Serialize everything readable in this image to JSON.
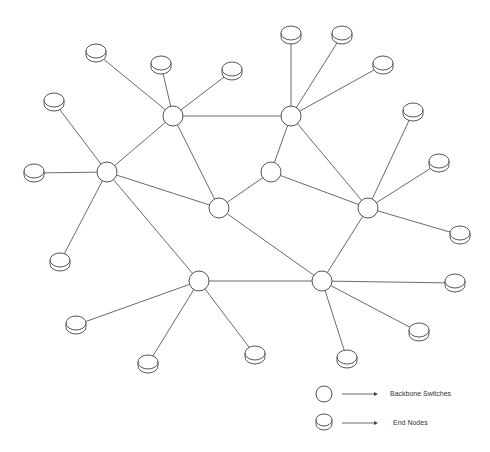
{
  "diagram": {
    "type": "network-topology",
    "switches": [
      {
        "id": "S1",
        "x": 173,
        "y": 116
      },
      {
        "id": "S2",
        "x": 291,
        "y": 116
      },
      {
        "id": "S3",
        "x": 107,
        "y": 172
      },
      {
        "id": "S4",
        "x": 271,
        "y": 172
      },
      {
        "id": "S5",
        "x": 219,
        "y": 208
      },
      {
        "id": "S6",
        "x": 368,
        "y": 208
      },
      {
        "id": "S7",
        "x": 199,
        "y": 281
      },
      {
        "id": "S8",
        "x": 322,
        "y": 281
      }
    ],
    "end_nodes": [
      {
        "id": "E1",
        "x": 96,
        "y": 51,
        "switch": "S1"
      },
      {
        "id": "E2",
        "x": 161,
        "y": 63,
        "switch": "S1"
      },
      {
        "id": "E3",
        "x": 232,
        "y": 69,
        "switch": "S1"
      },
      {
        "id": "E4",
        "x": 291,
        "y": 33,
        "switch": "S2"
      },
      {
        "id": "E5",
        "x": 342,
        "y": 33,
        "switch": "S2"
      },
      {
        "id": "E6",
        "x": 383,
        "y": 63,
        "switch": "S2"
      },
      {
        "id": "E7",
        "x": 54,
        "y": 100,
        "switch": "S3"
      },
      {
        "id": "E8",
        "x": 34,
        "y": 171,
        "switch": "S3"
      },
      {
        "id": "E9",
        "x": 60,
        "y": 260,
        "switch": "S3"
      },
      {
        "id": "E10",
        "x": 413,
        "y": 110,
        "switch": "S6"
      },
      {
        "id": "E11",
        "x": 439,
        "y": 161,
        "switch": "S6"
      },
      {
        "id": "E12",
        "x": 460,
        "y": 233,
        "switch": "S6"
      },
      {
        "id": "E13",
        "x": 76,
        "y": 323,
        "switch": "S7"
      },
      {
        "id": "E14",
        "x": 148,
        "y": 362,
        "switch": "S7"
      },
      {
        "id": "E15",
        "x": 255,
        "y": 353,
        "switch": "S7"
      },
      {
        "id": "E16",
        "x": 455,
        "y": 281,
        "switch": "S8"
      },
      {
        "id": "E17",
        "x": 419,
        "y": 330,
        "switch": "S8"
      },
      {
        "id": "E18",
        "x": 347,
        "y": 357,
        "switch": "S8"
      }
    ],
    "backbone_links": [
      [
        "S1",
        "S2"
      ],
      [
        "S1",
        "S3"
      ],
      [
        "S1",
        "S5"
      ],
      [
        "S2",
        "S4"
      ],
      [
        "S2",
        "S6"
      ],
      [
        "S3",
        "S5"
      ],
      [
        "S3",
        "S7"
      ],
      [
        "S4",
        "S5"
      ],
      [
        "S4",
        "S6"
      ],
      [
        "S5",
        "S8"
      ],
      [
        "S6",
        "S8"
      ],
      [
        "S7",
        "S8"
      ]
    ],
    "extra_links": [
      [
        "S3",
        "S7"
      ]
    ]
  },
  "legend": {
    "items": [
      {
        "symbol": "backbone-switch",
        "label": "Backbone Switches"
      },
      {
        "symbol": "end-node",
        "label": "End Nodes"
      }
    ]
  },
  "colors": {
    "stroke": "#555555",
    "link": "#6a6a6a",
    "background": "#ffffff"
  }
}
